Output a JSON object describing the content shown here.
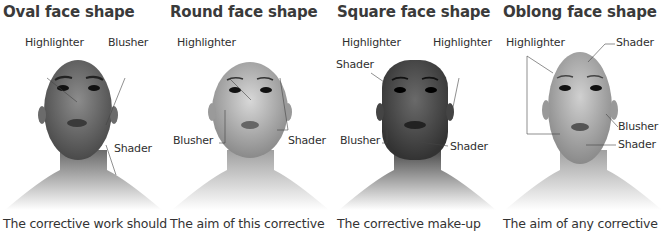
{
  "panels": [
    {
      "title": "Oval face shape",
      "caption": "The corrective work should",
      "skin": "#8a8a8a",
      "labels": {
        "a": "Highlighter",
        "b": "Blusher",
        "c": "Shader"
      }
    },
    {
      "title": "Round face shape",
      "caption": "The aim of this corrective",
      "skin": "#b5b5b5",
      "labels": {
        "a": "Highlighter",
        "b": "Blusher",
        "c": "Shader"
      }
    },
    {
      "title": "Square face shape",
      "caption": "The corrective make-up",
      "skin": "#6a6a6a",
      "labels": {
        "a": "Highlighter",
        "b": "Highlighter",
        "c": "Shader",
        "d": "Blusher",
        "e": "Shader"
      }
    },
    {
      "title": "Oblong face shape",
      "caption": "The aim of any corrective",
      "skin": "#b0b0b0",
      "labels": {
        "a": "Highlighter",
        "b": "Shader",
        "c": "Blusher",
        "d": "Shader"
      }
    }
  ]
}
